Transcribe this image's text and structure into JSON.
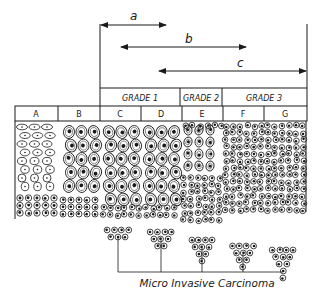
{
  "diagram": {
    "ink_color": "#1a1a1a",
    "background": "#ffffff",
    "ranges": [
      {
        "label": "a",
        "from_column": "C",
        "to_column": "D"
      },
      {
        "label": "b",
        "from_column": "C",
        "to_column": "F"
      },
      {
        "label": "c",
        "from_column": "D",
        "to_column": "G"
      }
    ],
    "grades": [
      {
        "label": "GRADE 1",
        "columns": [
          "C",
          "D"
        ]
      },
      {
        "label": "GRADE 2",
        "columns": [
          "E"
        ]
      },
      {
        "label": "GRADE 3",
        "columns": [
          "F",
          "G"
        ]
      }
    ],
    "columns": [
      "A",
      "B",
      "C",
      "D",
      "E",
      "F",
      "G"
    ],
    "caption": "Micro Invasive Carcinoma"
  }
}
